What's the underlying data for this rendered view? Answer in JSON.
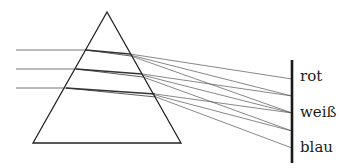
{
  "diagram": {
    "labels": {
      "red": "rot",
      "white": "weiß",
      "blue": "blau"
    },
    "colors": {
      "prism_stroke": "#222222",
      "ray_stroke": "#555555",
      "screen_stroke": "#1a1a1a",
      "background": "#ffffff"
    },
    "prism": {
      "apex": [
        107,
        12
      ],
      "bottom_left": [
        33,
        143
      ],
      "bottom_right": [
        181,
        143
      ]
    },
    "incoming_rays": [
      {
        "start": [
          16,
          50
        ],
        "entry": [
          86,
          50
        ],
        "exit": [
          130,
          55
        ]
      },
      {
        "start": [
          16,
          69
        ],
        "entry": [
          76,
          69
        ],
        "exit": [
          142,
          75
        ]
      },
      {
        "start": [
          16,
          88
        ],
        "entry": [
          66,
          88
        ],
        "exit": [
          155,
          95
        ]
      }
    ],
    "screen": {
      "x": 292,
      "top": 60,
      "bottom": 163
    },
    "screen_hits": [
      79,
      96,
      113,
      131,
      148
    ]
  }
}
